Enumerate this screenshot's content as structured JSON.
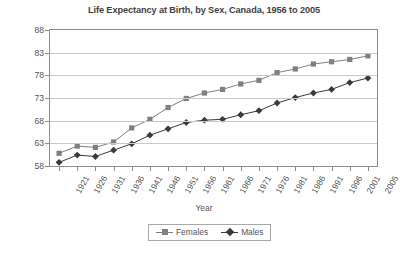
{
  "chart_data": {
    "type": "line",
    "title": "Life Expectancy at Birth, by Sex, Canada, 1956 to 2005",
    "xlabel": "Year",
    "ylabel": "Years",
    "ylim": [
      58,
      88
    ],
    "yticks": [
      58,
      63,
      68,
      73,
      78,
      83,
      88
    ],
    "grid": true,
    "legend_position": "bottom-center",
    "categories": [
      "1921",
      "1926",
      "1931",
      "1936",
      "1941",
      "1946",
      "1951",
      "1956",
      "1961",
      "1966",
      "1971",
      "1976",
      "1981",
      "1986",
      "1991",
      "1996",
      "2001",
      "2005"
    ],
    "series": [
      {
        "name": "Females",
        "marker": "square",
        "color": "#808080",
        "values": [
          60.8,
          62.4,
          62.1,
          63.3,
          66.4,
          68.3,
          70.9,
          72.9,
          74.1,
          74.9,
          76.1,
          76.9,
          78.6,
          79.4,
          80.5,
          81.0,
          81.5,
          82.3
        ]
      },
      {
        "name": "Males",
        "marker": "diamond",
        "color": "#3a3a3a",
        "values": [
          58.8,
          60.4,
          60.1,
          61.5,
          62.9,
          64.8,
          66.2,
          67.6,
          68.1,
          68.3,
          69.3,
          70.2,
          71.9,
          73.1,
          74.1,
          74.9,
          76.4,
          77.4
        ]
      }
    ]
  },
  "colors": {
    "frame": "#8e8e8e",
    "grid": "#c9c9c9",
    "text": "#555555",
    "title": "#3f3f3f",
    "females": "#808080",
    "males": "#3a3a3a",
    "background": "#ffffff"
  }
}
